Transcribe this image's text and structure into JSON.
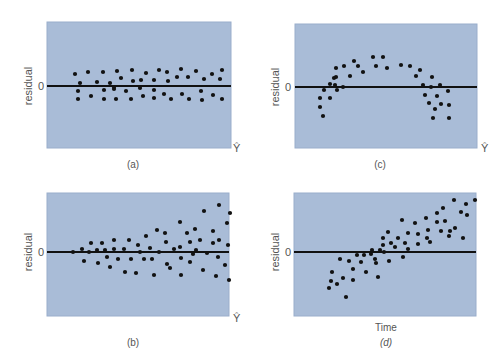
{
  "colors": {
    "plot_bg": "#a9bcd7",
    "plot_border": "#9aaecb",
    "zero_line": "#111111",
    "point": "#111111",
    "text": "#555555"
  },
  "labels": {
    "ylabel": "residual",
    "zero_tick": "0",
    "yhat": "Ŷ",
    "time": "Time"
  },
  "chart_data": [
    {
      "id": "a",
      "type": "scatter",
      "caption": "(a)",
      "title": "",
      "xlabel": "Ŷ",
      "ylabel": "residual",
      "ytick_labels": [
        "0"
      ],
      "pattern": "random horizontal band around zero (constant variance)",
      "box": {
        "x": 47,
        "y": 22,
        "w": 184,
        "h": 126
      },
      "zero_y": 86,
      "points": [
        [
          75,
          74
        ],
        [
          78,
          91
        ],
        [
          78,
          99
        ],
        [
          80,
          83
        ],
        [
          88,
          72
        ],
        [
          91,
          96
        ],
        [
          97,
          82
        ],
        [
          103,
          72
        ],
        [
          104,
          90
        ],
        [
          104,
          99
        ],
        [
          110,
          83
        ],
        [
          114,
          87
        ],
        [
          114,
          89
        ],
        [
          116,
          99
        ],
        [
          117,
          71
        ],
        [
          121,
          78
        ],
        [
          126,
          91
        ],
        [
          131,
          99
        ],
        [
          132,
          70
        ],
        [
          133,
          81
        ],
        [
          140,
          88
        ],
        [
          141,
          80
        ],
        [
          143,
          96
        ],
        [
          146,
          73
        ],
        [
          154,
          80
        ],
        [
          154,
          90
        ],
        [
          154,
          98
        ],
        [
          159,
          70
        ],
        [
          164,
          94
        ],
        [
          167,
          72
        ],
        [
          168,
          81
        ],
        [
          171,
          99
        ],
        [
          177,
          77
        ],
        [
          181,
          69
        ],
        [
          182,
          94
        ],
        [
          188,
          77
        ],
        [
          189,
          99
        ],
        [
          196,
          71
        ],
        [
          201,
          91
        ],
        [
          202,
          100
        ],
        [
          204,
          79
        ],
        [
          212,
          74
        ],
        [
          213,
          95
        ],
        [
          220,
          79
        ],
        [
          222,
          70
        ],
        [
          222,
          99
        ]
      ]
    },
    {
      "id": "c",
      "type": "scatter",
      "caption": "(c)",
      "title": "",
      "xlabel": "Ŷ",
      "ylabel": "residual",
      "ytick_labels": [
        "0"
      ],
      "pattern": "curved (inverted-U) — nonlinear relationship",
      "box": {
        "x": 295,
        "y": 24,
        "w": 182,
        "h": 124
      },
      "zero_y": 87,
      "points": [
        [
          320,
          98
        ],
        [
          320,
          107
        ],
        [
          323,
          116
        ],
        [
          324,
          90
        ],
        [
          330,
          84
        ],
        [
          330,
          98
        ],
        [
          334,
          78
        ],
        [
          335,
          85
        ],
        [
          336,
          77
        ],
        [
          337,
          90
        ],
        [
          336,
          68
        ],
        [
          344,
          66
        ],
        [
          343,
          87
        ],
        [
          350,
          76
        ],
        [
          354,
          61
        ],
        [
          358,
          66
        ],
        [
          363,
          72
        ],
        [
          373,
          57
        ],
        [
          376,
          66
        ],
        [
          383,
          57
        ],
        [
          387,
          68
        ],
        [
          401,
          65
        ],
        [
          410,
          66
        ],
        [
          416,
          76
        ],
        [
          420,
          70
        ],
        [
          423,
          85
        ],
        [
          425,
          95
        ],
        [
          429,
          103
        ],
        [
          432,
          77
        ],
        [
          431,
          87
        ],
        [
          433,
          118
        ],
        [
          435,
          109
        ],
        [
          437,
          96
        ],
        [
          440,
          85
        ],
        [
          441,
          104
        ],
        [
          448,
          91
        ],
        [
          449,
          118
        ],
        [
          449,
          105
        ]
      ]
    },
    {
      "id": "b",
      "type": "scatter",
      "caption": "(b)",
      "title": "",
      "xlabel": "Ŷ",
      "ylabel": "residual",
      "ytick_labels": [
        "0"
      ],
      "pattern": "funnel — variance increases with Ŷ (heteroscedasticity)",
      "box": {
        "x": 47,
        "y": 193,
        "w": 182,
        "h": 123
      },
      "zero_y": 252,
      "points": [
        [
          73,
          252
        ],
        [
          82,
          249
        ],
        [
          84,
          261
        ],
        [
          89,
          252
        ],
        [
          91,
          243
        ],
        [
          97,
          250
        ],
        [
          98,
          263
        ],
        [
          102,
          243
        ],
        [
          105,
          250
        ],
        [
          107,
          257
        ],
        [
          110,
          267
        ],
        [
          114,
          240
        ],
        [
          114,
          249
        ],
        [
          118,
          259
        ],
        [
          124,
          249
        ],
        [
          125,
          272
        ],
        [
          129,
          240
        ],
        [
          131,
          259
        ],
        [
          136,
          273
        ],
        [
          138,
          245
        ],
        [
          140,
          252
        ],
        [
          144,
          259
        ],
        [
          146,
          236
        ],
        [
          150,
          248
        ],
        [
          152,
          259
        ],
        [
          154,
          275
        ],
        [
          157,
          230
        ],
        [
          159,
          252
        ],
        [
          165,
          233
        ],
        [
          166,
          242
        ],
        [
          167,
          264
        ],
        [
          170,
          268
        ],
        [
          174,
          249
        ],
        [
          180,
          222
        ],
        [
          180,
          247
        ],
        [
          181,
          258
        ],
        [
          181,
          275
        ],
        [
          187,
          233
        ],
        [
          190,
          242
        ],
        [
          190,
          262
        ],
        [
          193,
          254
        ],
        [
          195,
          229
        ],
        [
          196,
          250
        ],
        [
          200,
          240
        ],
        [
          203,
          270
        ],
        [
          204,
          211
        ],
        [
          207,
          253
        ],
        [
          213,
          231
        ],
        [
          213,
          243
        ],
        [
          216,
          276
        ],
        [
          218,
          257
        ],
        [
          219,
          205
        ],
        [
          219,
          240
        ],
        [
          225,
          265
        ],
        [
          227,
          223
        ],
        [
          228,
          245
        ],
        [
          229,
          280
        ],
        [
          230,
          213
        ]
      ]
    },
    {
      "id": "d",
      "type": "scatter",
      "caption": "(d)",
      "title": "",
      "xlabel": "Time",
      "ylabel": "residual",
      "ytick_labels": [
        "0"
      ],
      "pattern": "linear upward trend over time (autocorrelation)",
      "box": {
        "x": 294,
        "y": 193,
        "w": 182,
        "h": 123
      },
      "zero_y": 252,
      "points": [
        [
          329,
          288
        ],
        [
          331,
          281
        ],
        [
          332,
          272
        ],
        [
          337,
          284
        ],
        [
          340,
          259
        ],
        [
          343,
          278
        ],
        [
          346,
          297
        ],
        [
          349,
          261
        ],
        [
          353,
          269
        ],
        [
          353,
          280
        ],
        [
          357,
          255
        ],
        [
          361,
          262
        ],
        [
          364,
          255
        ],
        [
          366,
          272
        ],
        [
          371,
          254
        ],
        [
          372,
          250
        ],
        [
          375,
          259
        ],
        [
          376,
          263
        ],
        [
          378,
          277
        ],
        [
          380,
          250
        ],
        [
          383,
          245
        ],
        [
          383,
          238
        ],
        [
          384,
          252
        ],
        [
          388,
          232
        ],
        [
          389,
          261
        ],
        [
          391,
          243
        ],
        [
          395,
          247
        ],
        [
          398,
          238
        ],
        [
          403,
          257
        ],
        [
          402,
          220
        ],
        [
          405,
          243
        ],
        [
          408,
          233
        ],
        [
          408,
          249
        ],
        [
          415,
          223
        ],
        [
          418,
          234
        ],
        [
          418,
          244
        ],
        [
          427,
          238
        ],
        [
          426,
          218
        ],
        [
          428,
          230
        ],
        [
          430,
          242
        ],
        [
          437,
          213
        ],
        [
          437,
          222
        ],
        [
          441,
          231
        ],
        [
          443,
          208
        ],
        [
          445,
          221
        ],
        [
          449,
          236
        ],
        [
          450,
          231
        ],
        [
          454,
          200
        ],
        [
          455,
          228
        ],
        [
          461,
          212
        ],
        [
          463,
          238
        ],
        [
          466,
          204
        ],
        [
          467,
          215
        ],
        [
          475,
          200
        ]
      ]
    }
  ]
}
